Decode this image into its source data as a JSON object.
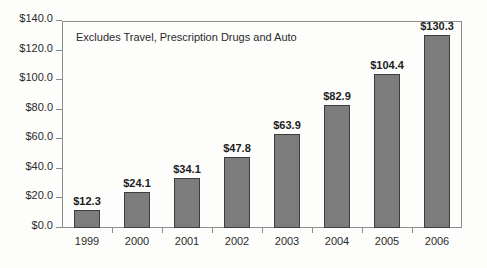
{
  "chart_data": {
    "type": "bar",
    "title": "",
    "subtitle": "",
    "annotation": "Excludes Travel, Prescription Drugs and Auto",
    "categories": [
      "1999",
      "2000",
      "2001",
      "2002",
      "2003",
      "2004",
      "2005",
      "2006"
    ],
    "values": [
      12.3,
      24.1,
      34.1,
      47.8,
      63.9,
      82.9,
      104.4,
      130.3
    ],
    "value_labels": [
      "$12.3",
      "$24.1",
      "$34.1",
      "$47.8",
      "$63.9",
      "$82.9",
      "$104.4",
      "$130.3"
    ],
    "series": [
      {
        "name": "",
        "values": [
          12.3,
          24.1,
          34.1,
          47.8,
          63.9,
          82.9,
          104.4,
          130.3
        ]
      }
    ],
    "xlabel": "",
    "ylabel": "",
    "ylim": [
      0,
      140
    ],
    "ytick_values": [
      0,
      20,
      40,
      60,
      80,
      100,
      120,
      140
    ],
    "ytick_labels": [
      "$0.0",
      "$20.0",
      "$40.0",
      "$60.0",
      "$80.0",
      "$100.0",
      "$120.0",
      "$140.0"
    ],
    "grid": false,
    "legend": false,
    "legend_position": "none",
    "bar_color": "#7c7c7c",
    "bar_border_color": "#3d3d3d",
    "axis_color": "#8d8d8d",
    "text_color": "#2b2b2b",
    "background_color": "#fdfdfc"
  }
}
